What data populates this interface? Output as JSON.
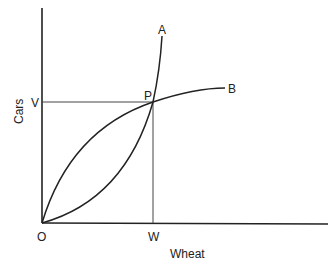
{
  "diagram": {
    "axes": {
      "x_label": "Wheat",
      "y_label": "Cars",
      "origin_label": "O"
    },
    "points": {
      "intersection": "P",
      "x_tick": "W",
      "y_tick": "V"
    },
    "curves": [
      {
        "label": "A",
        "shape": "convex, rising steeply from O through P"
      },
      {
        "label": "B",
        "shape": "concave, rising from O through P and flattening"
      }
    ],
    "colors": {
      "line": "#222222",
      "background": "#ffffff"
    }
  }
}
